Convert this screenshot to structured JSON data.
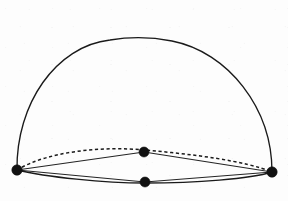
{
  "figure": {
    "title": "Hemisphere with equatorial ellipse and four marked points",
    "caption": "",
    "style": "hand-drawn scanned line diagram",
    "background_color": "#fdfdfd",
    "ink_color": "#1a1a1a",
    "canvas": {
      "width": 288,
      "height": 201
    }
  },
  "geometry": {
    "dome": {
      "name": "hemisphere-outline",
      "description": "Great semicircular arc forming the silhouette of the dome",
      "apex": {
        "x": 145,
        "y": 39
      },
      "left_end": {
        "x": 17,
        "y": 170
      },
      "right_end": {
        "x": 272,
        "y": 172
      },
      "stroke": "solid"
    },
    "equator_back": {
      "name": "equator-back-arc",
      "description": "Hidden rear half of the equatorial ellipse, drawn dashed, bulging upward through the upper middle point",
      "stroke": "dashed",
      "passes_through": {
        "x": 144,
        "y": 152
      }
    },
    "equator_front": {
      "name": "equator-front-arc",
      "description": "Visible front half of the equatorial ellipse, drawn solid, bulging downward through the lower middle point",
      "stroke": "solid",
      "passes_through": {
        "x": 145,
        "y": 182
      }
    },
    "chord_upper_left": {
      "name": "chord-left-to-upper-node",
      "from": "left-vertex",
      "to": "upper-middle-node",
      "stroke": "solid"
    },
    "chord_upper_right": {
      "name": "chord-upper-node-to-right",
      "from": "upper-middle-node",
      "to": "right-vertex",
      "stroke": "solid"
    },
    "chord_lower_left": {
      "name": "chord-left-to-lower-node",
      "from": "left-vertex",
      "to": "lower-middle-node",
      "stroke": "solid"
    },
    "chord_lower_right": {
      "name": "chord-lower-node-to-right",
      "from": "lower-middle-node",
      "to": "right-vertex",
      "stroke": "solid"
    }
  },
  "points": [
    {
      "id": "left-vertex",
      "label": "",
      "x": 17,
      "y": 170,
      "radius": 5.2
    },
    {
      "id": "upper-middle-node",
      "label": "",
      "x": 144,
      "y": 152,
      "radius": 5.0
    },
    {
      "id": "lower-middle-node",
      "label": "",
      "x": 145,
      "y": 182,
      "radius": 5.0
    },
    {
      "id": "right-vertex",
      "label": "",
      "x": 272,
      "y": 172,
      "radius": 5.2
    }
  ],
  "labels": [],
  "chart_data": {
    "type": "diagram",
    "title": "Hemisphere with equatorial ellipse and four marked points",
    "elements": [
      "hemisphere-outline",
      "equator-back-arc",
      "equator-front-arc",
      "chord-left-to-upper-node",
      "chord-upper-node-to-right",
      "chord-left-to-lower-node",
      "chord-lower-node-to-right",
      "four-vertex-dots"
    ]
  }
}
